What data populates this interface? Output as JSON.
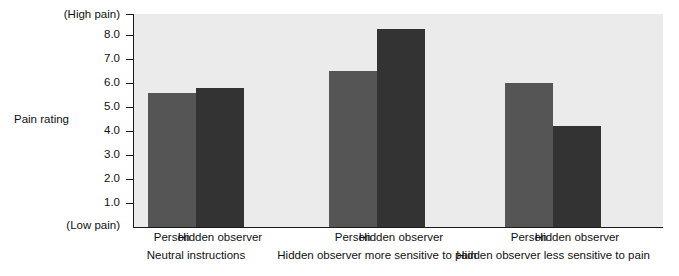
{
  "chart_data": {
    "type": "bar",
    "title": "",
    "xlabel": "",
    "ylabel": "Pain rating",
    "ylim": [
      0,
      9
    ],
    "grid": false,
    "legend_position": "none",
    "y_axis": {
      "top_annotation": "(High pain)",
      "bottom_annotation": "(Low pain)",
      "tick_labels": [
        "8.0",
        "7.0",
        "6.0",
        "5.0",
        "4.0",
        "3.0",
        "2.0",
        "1.0"
      ],
      "tick_values": [
        8.0,
        7.0,
        6.0,
        5.0,
        4.0,
        3.0,
        2.0,
        1.0
      ]
    },
    "categories": [
      "Neutral instructions",
      "Hidden observer more sensitive to pain",
      "Hidden observer less sensitive to pain"
    ],
    "series": [
      {
        "name": "Person",
        "values": [
          5.6,
          6.5,
          6.0
        ],
        "color": "#555555"
      },
      {
        "name": "Hidden observer",
        "values": [
          5.8,
          8.25,
          4.2
        ],
        "color": "#333333"
      }
    ],
    "bars": [
      {
        "group": 0,
        "series": "Person",
        "label": "Person",
        "value": 5.6,
        "color": "#555555"
      },
      {
        "group": 0,
        "series": "Hidden observer",
        "label": "Hidden observer",
        "value": 5.8,
        "color": "#333333"
      },
      {
        "group": 1,
        "series": "Person",
        "label": "Person",
        "value": 6.5,
        "color": "#555555"
      },
      {
        "group": 1,
        "series": "Hidden observer",
        "label": "Hidden observer",
        "value": 8.25,
        "color": "#333333"
      },
      {
        "group": 2,
        "series": "Person",
        "label": "Person",
        "value": 6.0,
        "color": "#555555"
      },
      {
        "group": 2,
        "series": "Hidden observer",
        "label": "Hidden observer",
        "value": 4.2,
        "color": "#333333"
      }
    ],
    "colors": {
      "plot_background": "#ebebeb",
      "page_background": "#ffffff",
      "axis": "#1a1a1a",
      "text": "#111111",
      "series_person": "#555555",
      "series_hidden_observer": "#333333"
    }
  }
}
